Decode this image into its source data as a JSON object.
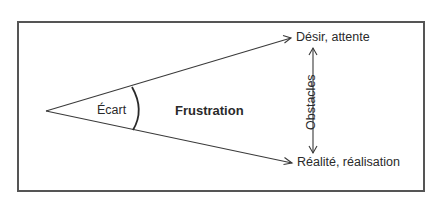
{
  "diagram": {
    "title": "",
    "labels": {
      "gap": "Écart",
      "frustration": "Frustration",
      "desire": "Désir, attente",
      "reality": "Réalité, réalisation",
      "obstacles": "Obstacles"
    },
    "nodes": [
      {
        "id": "apex",
        "label": ""
      },
      {
        "id": "desire",
        "label": "Désir, attente"
      },
      {
        "id": "reality",
        "label": "Réalité, réalisation"
      }
    ],
    "edges": [
      {
        "from": "apex",
        "to": "desire",
        "type": "arrow"
      },
      {
        "from": "apex",
        "to": "reality",
        "type": "arrow"
      },
      {
        "from": "desire",
        "to": "reality",
        "type": "double-arrow",
        "label": "Obstacles"
      }
    ],
    "annotations": [
      {
        "text": "Écart",
        "type": "angle-arc"
      },
      {
        "text": "Frustration",
        "style": "bold"
      }
    ],
    "colors": {
      "line": "#3a3a3a",
      "text": "#2a2a2a",
      "frame": "#555555",
      "background": "#ffffff"
    }
  }
}
